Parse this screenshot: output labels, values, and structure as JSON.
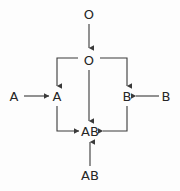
{
  "diagram": {
    "background_color": "#fdfdfd",
    "stroke_color": "#3a3a3a",
    "text_color": "#262626",
    "nodes": [
      {
        "id": "o-top",
        "label": "O",
        "x": 89,
        "y": 14,
        "role": "source-allele"
      },
      {
        "id": "o-center",
        "label": "O",
        "x": 89,
        "y": 60,
        "role": "genotype"
      },
      {
        "id": "a-left",
        "label": "A",
        "x": 14,
        "y": 96,
        "role": "source-allele"
      },
      {
        "id": "a-node",
        "label": "A",
        "x": 57,
        "y": 96,
        "role": "genotype"
      },
      {
        "id": "b-node",
        "label": "B",
        "x": 127,
        "y": 96,
        "role": "genotype"
      },
      {
        "id": "b-right",
        "label": "B",
        "x": 166,
        "y": 96,
        "role": "source-allele"
      },
      {
        "id": "ab-node",
        "label": "AB",
        "x": 90,
        "y": 131,
        "role": "genotype"
      },
      {
        "id": "ab-bottom",
        "label": "AB",
        "x": 90,
        "y": 175,
        "role": "source-allele"
      }
    ],
    "edges": [
      {
        "id": "e-o-top-to-o-center",
        "from": "o-top",
        "to": "o-center",
        "kind": "straight-vertical",
        "arrow": "down"
      },
      {
        "id": "e-o-to-a",
        "from": "o-center",
        "to": "a-node",
        "kind": "elbow-left-down",
        "arrow": "down"
      },
      {
        "id": "e-o-to-b",
        "from": "o-center",
        "to": "b-node",
        "kind": "elbow-right-down",
        "arrow": "down"
      },
      {
        "id": "e-o-to-ab",
        "from": "o-center",
        "to": "ab-node",
        "kind": "straight-vertical",
        "arrow": "down"
      },
      {
        "id": "e-a-left-to-a",
        "from": "a-left",
        "to": "a-node",
        "kind": "straight-horizontal",
        "arrow": "right"
      },
      {
        "id": "e-b-right-to-b",
        "from": "b-right",
        "to": "b-node",
        "kind": "straight-horizontal",
        "arrow": "left"
      },
      {
        "id": "e-a-to-ab",
        "from": "a-node",
        "to": "ab-node",
        "kind": "elbow-down-right",
        "arrow": "right"
      },
      {
        "id": "e-b-to-ab",
        "from": "b-node",
        "to": "ab-node",
        "kind": "elbow-down-left",
        "arrow": "left"
      },
      {
        "id": "e-ab-bottom-to-ab",
        "from": "ab-bottom",
        "to": "ab-node",
        "kind": "straight-vertical",
        "arrow": "up"
      }
    ]
  }
}
